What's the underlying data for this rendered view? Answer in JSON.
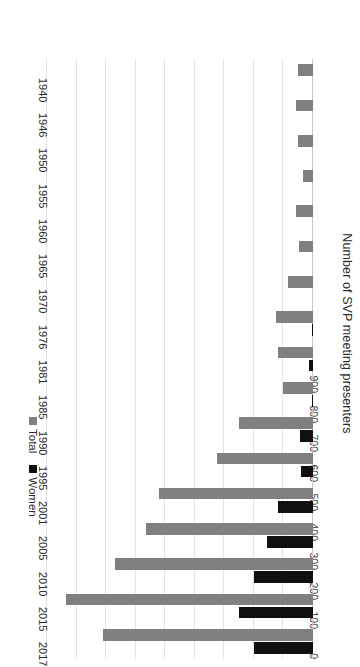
{
  "chart_data": {
    "type": "bar",
    "orientation": "horizontal",
    "title": "",
    "subtitle": "",
    "xlabel": "Number of SVP meeting presenters",
    "ylabel": "",
    "xlim": [
      0,
      900
    ],
    "grid": true,
    "legend_position": "bottom-left",
    "categories": [
      "1940",
      "1946",
      "1950",
      "1955",
      "1960",
      "1965",
      "1970",
      "1976",
      "1981",
      "1985",
      "1990",
      "1995",
      "2001",
      "2005",
      "2010",
      "2015",
      "2017"
    ],
    "tick_labels": [
      "0",
      "100",
      "200",
      "300",
      "400",
      "500",
      "600",
      "700",
      "800",
      "900"
    ],
    "tick_values": [
      0,
      100,
      200,
      300,
      400,
      500,
      600,
      700,
      800,
      900
    ],
    "series": [
      {
        "name": "Total",
        "color": "#808080",
        "values": [
          52,
          58,
          52,
          33,
          58,
          48,
          85,
          125,
          120,
          100,
          250,
          325,
          520,
          565,
          670,
          835,
          710
        ]
      },
      {
        "name": "Women",
        "color": "#101010",
        "values": [
          0,
          0,
          0,
          0,
          0,
          0,
          0,
          5,
          15,
          4,
          45,
          40,
          120,
          155,
          200,
          250,
          200
        ]
      }
    ]
  },
  "legend": {
    "items": [
      {
        "label": "Total",
        "color": "#808080"
      },
      {
        "label": "Women",
        "color": "#101010"
      }
    ]
  },
  "axis": {
    "value_axis_title": "Number of SVP meeting presenters"
  },
  "colors": {
    "total": "#808080",
    "women": "#101010",
    "gridline": "#e2e2e2",
    "zero_line": "#c9c9c9",
    "text": "#2b2b2b",
    "background": "#ffffff"
  }
}
